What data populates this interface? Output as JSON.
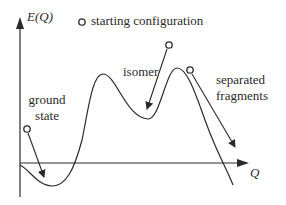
{
  "diagram": {
    "y_axis_label": "E(Q)",
    "x_axis_label": "Q",
    "legend": {
      "marker": "open-circle",
      "label": "starting configuration"
    },
    "annotations": {
      "ground_state": {
        "line1": "ground",
        "line2": "state"
      },
      "isomer": {
        "label": "isomer"
      },
      "separated_fragments": {
        "line1": "separated",
        "line2": "fragments"
      }
    },
    "colors": {
      "stroke": "#2a2a2a",
      "background": "#ffffff"
    }
  }
}
